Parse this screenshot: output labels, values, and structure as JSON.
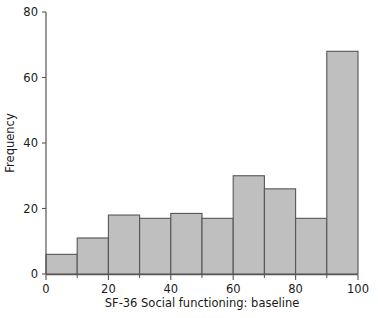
{
  "chart_data": {
    "type": "bar",
    "title": "",
    "subtitle": "",
    "xlabel": "SF-36 Social functioning: baseline",
    "ylabel": "Frequency",
    "xlim": [
      0,
      100
    ],
    "ylim": [
      0,
      80
    ],
    "grid": false,
    "legend": null,
    "bin_width": 10,
    "bin_edges": [
      0,
      10,
      20,
      30,
      40,
      50,
      60,
      70,
      80,
      90,
      100
    ],
    "categories": [
      "0-10",
      "10-20",
      "20-30",
      "30-40",
      "40-50",
      "50-60",
      "60-70",
      "70-80",
      "80-90",
      "90-100"
    ],
    "values": [
      6,
      11,
      18,
      17,
      18.5,
      17,
      30,
      26,
      17,
      68
    ],
    "x_tick_labels": [
      "0",
      "20",
      "40",
      "60",
      "80",
      "100"
    ],
    "x_tick_values": [
      0,
      20,
      40,
      60,
      80,
      100
    ],
    "x_minor_tick_values": [
      10,
      30,
      50,
      70,
      90
    ],
    "y_tick_labels": [
      "0",
      "20",
      "40",
      "60",
      "80"
    ],
    "y_tick_values": [
      0,
      20,
      40,
      60,
      80
    ],
    "colors": {
      "bar_fill": "#bfbfbf",
      "bar_edge": "#555555",
      "axis": "#555555",
      "text": "#1a1a1a",
      "background": "#ffffff"
    }
  }
}
